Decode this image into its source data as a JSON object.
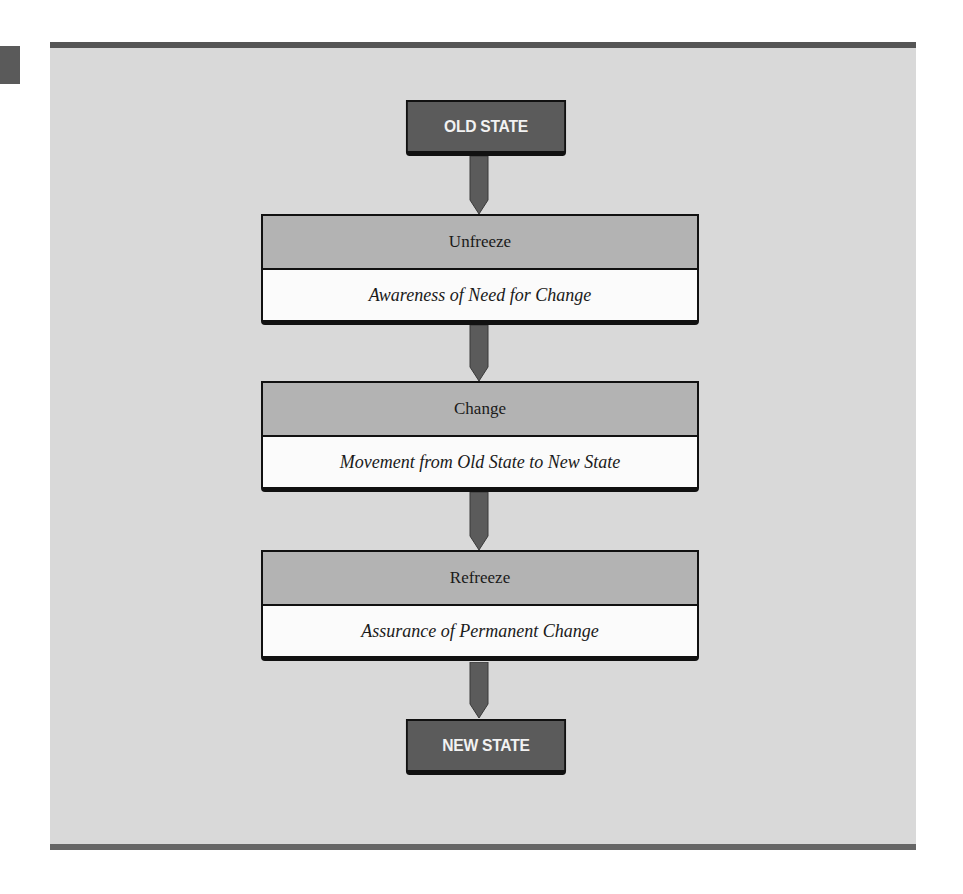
{
  "diagram": {
    "start_state": "OLD STATE",
    "end_state": "NEW STATE",
    "stages": [
      {
        "name": "Unfreeze",
        "description": "Awareness of Need for Change"
      },
      {
        "name": "Change",
        "description": "Movement from Old State to New State"
      },
      {
        "name": "Refreeze",
        "description": "Assurance of Permanent Change"
      }
    ],
    "flow": [
      "OLD STATE",
      "Unfreeze",
      "Change",
      "Refreeze",
      "NEW STATE"
    ]
  },
  "colors": {
    "panel": "#d9d9d9",
    "state_box": "#5b5b5b",
    "stage_header": "#b3b3b3",
    "arrow": "#5b5b5b",
    "rule": "#555555"
  }
}
